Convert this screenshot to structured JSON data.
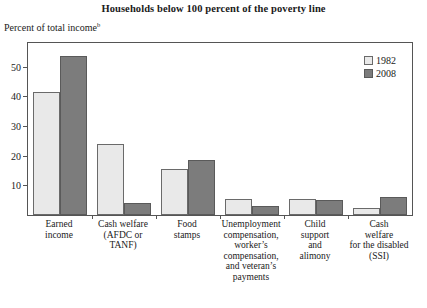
{
  "chart_data": {
    "type": "bar",
    "title": "Households below 100 percent of the poverty line",
    "ylabel": "Percent of total income",
    "ylabel_superscript": "b",
    "xlabel": "",
    "ylim": [
      0,
      58
    ],
    "yticks": [
      10,
      20,
      30,
      40,
      50
    ],
    "ytick_labels": [
      "10",
      "20",
      "30",
      "40",
      "50"
    ],
    "grid": false,
    "legend_position": "top-right",
    "categories": [
      "Earned\nincome",
      "Cash welfare\n(AFDC or\nTANF)",
      "Food\nstamps",
      "Unemployment\ncompensation,\nworker’s\ncompensation,\nand veteran’s\npayments",
      "Child\nsupport\nand\nalimony",
      "Cash\nwelfare\nfor the disabled\n(SSI)"
    ],
    "series": [
      {
        "name": "1982",
        "color": "#e9e9e9",
        "values": [
          41.5,
          24.0,
          15.5,
          5.5,
          5.5,
          2.5
        ]
      },
      {
        "name": "2008",
        "color": "#7c7c7c",
        "values": [
          53.5,
          4.0,
          18.5,
          3.0,
          5.0,
          6.0
        ]
      }
    ]
  },
  "legend": {
    "entries": [
      {
        "label": "1982",
        "swatch": "light-gray"
      },
      {
        "label": "2008",
        "swatch": "dark-gray"
      }
    ]
  }
}
